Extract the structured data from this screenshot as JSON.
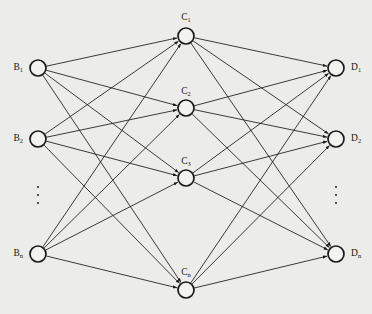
{
  "figure": {
    "type": "neural-network-diagram",
    "background_color": "#ececeb",
    "stroke_color": "#1a1a1a",
    "node_fill_color": "#f2f2f1",
    "width": 372,
    "height": 314,
    "caption": ""
  },
  "layers": [
    {
      "id": "layer-b",
      "name": "B",
      "position": "left",
      "x": 38,
      "label_anchor": "end",
      "nodes": [
        {
          "id": "B1",
          "base": "B",
          "sub": "1",
          "x": 38,
          "y": 68,
          "r": 8,
          "label_x": 23,
          "label_y": 68
        },
        {
          "id": "B2",
          "base": "B",
          "sub": "2",
          "x": 38,
          "y": 139,
          "r": 8,
          "label_x": 23,
          "label_y": 139
        },
        {
          "id": "Bn",
          "base": "B",
          "sub": "n",
          "x": 38,
          "y": 254,
          "r": 8,
          "label_x": 23,
          "label_y": 254
        }
      ],
      "ellipsis": {
        "x": 38,
        "y": 195,
        "dots": 3
      }
    },
    {
      "id": "layer-c",
      "name": "C",
      "position": "middle",
      "x": 186,
      "label_anchor": "middle",
      "nodes": [
        {
          "id": "C1",
          "base": "C",
          "sub": "1",
          "x": 186,
          "y": 36,
          "r": 8,
          "label_x": 186,
          "label_y": 18
        },
        {
          "id": "C2",
          "base": "C",
          "sub": "2",
          "x": 186,
          "y": 108,
          "r": 8,
          "label_x": 186,
          "label_y": 92
        },
        {
          "id": "C3",
          "base": "C",
          "sub": "3",
          "x": 186,
          "y": 178,
          "r": 8,
          "label_x": 186,
          "label_y": 162
        },
        {
          "id": "Cn",
          "base": "C",
          "sub": "n",
          "x": 186,
          "y": 290,
          "r": 8,
          "label_x": 186,
          "label_y": 273
        }
      ],
      "ellipsis": null
    },
    {
      "id": "layer-d",
      "name": "D",
      "position": "right",
      "x": 336,
      "label_anchor": "start",
      "nodes": [
        {
          "id": "D1",
          "base": "D",
          "sub": "1",
          "x": 336,
          "y": 68,
          "r": 8,
          "label_x": 351,
          "label_y": 68
        },
        {
          "id": "D2",
          "base": "D",
          "sub": "2",
          "x": 336,
          "y": 139,
          "r": 8,
          "label_x": 351,
          "label_y": 139
        },
        {
          "id": "Dn",
          "base": "D",
          "sub": "n",
          "x": 336,
          "y": 254,
          "r": 8,
          "label_x": 351,
          "label_y": 254
        }
      ],
      "ellipsis": {
        "x": 336,
        "y": 195,
        "dots": 3
      }
    }
  ],
  "connections": {
    "b_to_c": "fully-connected",
    "c_to_d": "fully-connected",
    "directed": true,
    "arrowheads": "target-end"
  }
}
